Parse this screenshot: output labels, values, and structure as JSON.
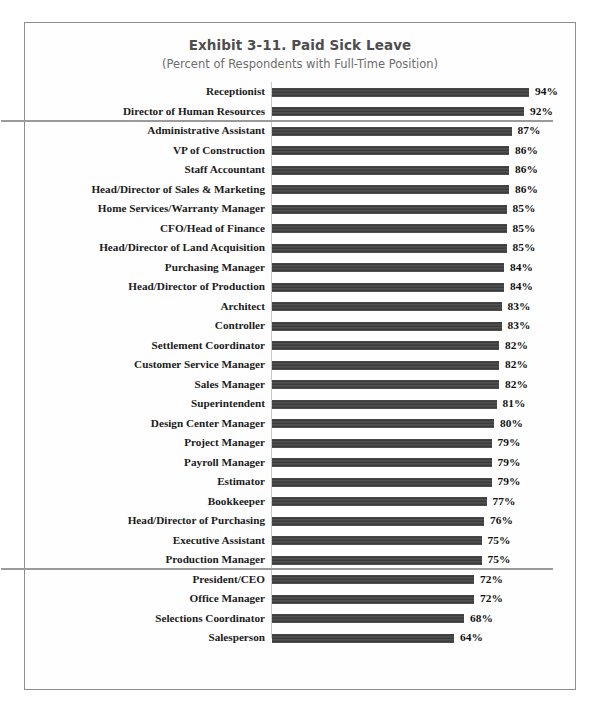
{
  "chart_data": {
    "type": "bar",
    "orientation": "horizontal",
    "title": "Exhibit 3-11.  Paid Sick Leave",
    "subtitle": "(Percent of Respondents with Full-Time Position)",
    "xlabel": "",
    "ylabel": "",
    "xlim": [
      0,
      100
    ],
    "grid": false,
    "legend": null,
    "value_suffix": "%",
    "bar_color": "#474747",
    "separator_color": "#9a9a9a",
    "separator_after_rows": [
      2,
      25
    ],
    "categories": [
      "Receptionist",
      "Director of Human Resources",
      "Administrative Assistant",
      "VP of Construction",
      "Staff Accountant",
      "Head/Director of Sales & Marketing",
      "Home Services/Warranty Manager",
      "CFO/Head of Finance",
      "Head/Director of Land Acquisition",
      "Purchasing Manager",
      "Head/Director of Production",
      "Architect",
      "Controller",
      "Settlement Coordinator",
      "Customer Service Manager",
      "Sales Manager",
      "Superintendent",
      "Design Center Manager",
      "Project Manager",
      "Payroll Manager",
      "Estimator",
      "Bookkeeper",
      "Head/Director of Purchasing",
      "Executive Assistant",
      "Production Manager",
      "President/CEO",
      "Office Manager",
      "Selections Coordinator",
      "Salesperson"
    ],
    "values": [
      94,
      92,
      87,
      86,
      86,
      86,
      85,
      85,
      85,
      84,
      84,
      83,
      83,
      82,
      82,
      82,
      81,
      80,
      79,
      79,
      79,
      77,
      76,
      75,
      75,
      72,
      72,
      68,
      64
    ],
    "value_labels": [
      "94%",
      "92%",
      "87%",
      "86%",
      "86%",
      "86%",
      "85%",
      "85%",
      "85%",
      "84%",
      "84%",
      "83%",
      "83%",
      "82%",
      "82%",
      "82%",
      "81%",
      "80%",
      "79%",
      "79%",
      "79%",
      "77%",
      "76%",
      "75%",
      "75%",
      "72%",
      "72%",
      "68%",
      "64%"
    ]
  }
}
